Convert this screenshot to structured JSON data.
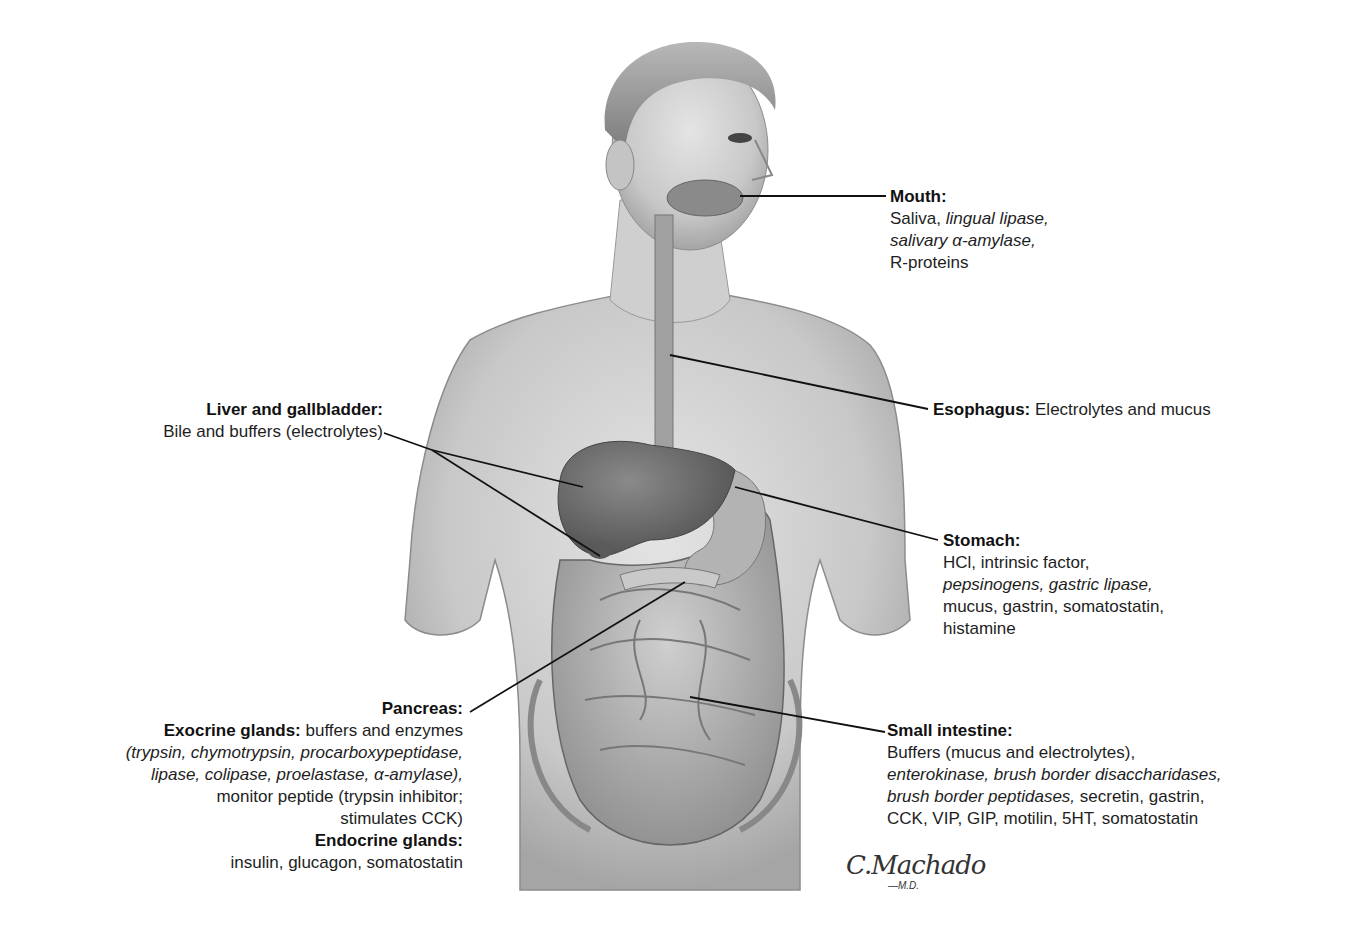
{
  "figure": {
    "signature": {
      "name": "C.Machado",
      "suffix": "—M.D."
    }
  },
  "labels": {
    "mouth": {
      "title": "Mouth:",
      "lines": [
        [
          {
            "text": "Saliva, ",
            "italic": false
          },
          {
            "text": "lingual lipase,",
            "italic": true
          }
        ],
        [
          {
            "text": "salivary α-amylase,",
            "italic": true
          }
        ],
        [
          {
            "text": "R-proteins",
            "italic": false
          }
        ]
      ]
    },
    "liver": {
      "title": "Liver and gallbladder:",
      "lines": [
        [
          {
            "text": "Bile and buffers (electrolytes)",
            "italic": false
          }
        ]
      ]
    },
    "esophagus": {
      "title": "Esophagus:",
      "inline_text": " Electrolytes and mucus"
    },
    "stomach": {
      "title": "Stomach:",
      "lines": [
        [
          {
            "text": "HCl, intrinsic factor,",
            "italic": false
          }
        ],
        [
          {
            "text": "pepsinogens, gastric lipase,",
            "italic": true
          }
        ],
        [
          {
            "text": "mucus, gastrin, somatostatin,",
            "italic": false
          }
        ],
        [
          {
            "text": "histamine",
            "italic": false
          }
        ]
      ]
    },
    "pancreas": {
      "title": "Pancreas:",
      "exocrine_title": "Exocrine glands:",
      "exocrine_inline": " buffers and enzymes",
      "exocrine_lines": [
        [
          {
            "text": "(trypsin, chymotrypsin, procarboxypeptidase,",
            "italic": true
          }
        ],
        [
          {
            "text": "lipase, colipase, proelastase, α-amylase),",
            "italic": true
          }
        ],
        [
          {
            "text": "monitor peptide (trypsin inhibitor;",
            "italic": false
          }
        ],
        [
          {
            "text": "stimulates CCK)",
            "italic": false
          }
        ]
      ],
      "endocrine_title": "Endocrine glands:",
      "endocrine_lines": [
        [
          {
            "text": "insulin, glucagon, somatostatin",
            "italic": false
          }
        ]
      ]
    },
    "small_intestine": {
      "title": "Small intestine:",
      "lines": [
        [
          {
            "text": "Buffers (mucus and electrolytes),",
            "italic": false
          }
        ],
        [
          {
            "text": "enterokinase, brush border disaccharidases,",
            "italic": true
          }
        ],
        [
          {
            "text": "brush border peptidases,",
            "italic": true
          },
          {
            "text": " secretin, gastrin,",
            "italic": false
          }
        ],
        [
          {
            "text": "CCK, VIP, GIP, motilin, 5HT, somatostatin",
            "italic": false
          }
        ]
      ]
    }
  },
  "colors": {
    "skin": "#d4d4d4",
    "skin_shadow": "#9a9a9a",
    "organ": "#6e6e6e",
    "intestine": "#b8b8b8",
    "leader_line": "#111111"
  }
}
